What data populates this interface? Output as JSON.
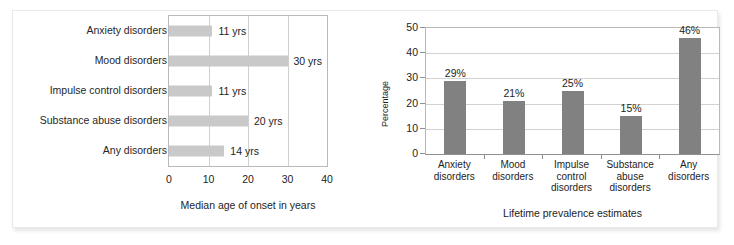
{
  "figure": {
    "background": "#ffffff",
    "border_color": "#e9e9e9"
  },
  "chart_data": [
    {
      "id": "median-age-of-onset",
      "type": "bar",
      "orientation": "horizontal",
      "title": "",
      "xlabel": "Median age of onset in years",
      "ylabel": "",
      "categories": [
        "Anxiety disorders",
        "Mood disorders",
        "Impulse control disorders",
        "Substance abuse disorders",
        "Any disorders"
      ],
      "values": [
        11,
        30,
        11,
        20,
        14
      ],
      "data_labels": [
        "11 yrs",
        "30 yrs",
        "11 yrs",
        "20 yrs",
        "14 yrs"
      ],
      "xlim": [
        0,
        40
      ],
      "xticks": [
        0,
        10,
        20,
        30,
        40
      ],
      "xtick_labels": [
        "0",
        "10",
        "20",
        "30",
        "40"
      ],
      "grid": "vertical",
      "bar_color": "#c9c9c9",
      "legend": "none"
    },
    {
      "id": "lifetime-prevalence-estimates",
      "type": "bar",
      "orientation": "vertical",
      "title": "",
      "xlabel": "Lifetime prevalence estimates",
      "ylabel": "Percentage",
      "categories": [
        "Anxiety\ndisorders",
        "Mood\ndisorders",
        "Impulse\ncontrol\ndisorders",
        "Substance\nabuse\ndisorders",
        "Any\ndisorders"
      ],
      "category_lines": [
        [
          "Anxiety",
          "disorders"
        ],
        [
          "Mood",
          "disorders"
        ],
        [
          "Impulse",
          "control",
          "disorders"
        ],
        [
          "Substance",
          "abuse",
          "disorders"
        ],
        [
          "Any",
          "disorders"
        ]
      ],
      "values": [
        29,
        21,
        25,
        15,
        46
      ],
      "data_labels": [
        "29%",
        "21%",
        "25%",
        "15%",
        "46%"
      ],
      "ylim": [
        0,
        50
      ],
      "yticks": [
        0,
        10,
        20,
        30,
        40,
        50
      ],
      "ytick_labels": [
        "0",
        "10",
        "20",
        "30",
        "40",
        "50"
      ],
      "grid": "horizontal",
      "bar_color": "#818181",
      "legend": "none"
    }
  ]
}
